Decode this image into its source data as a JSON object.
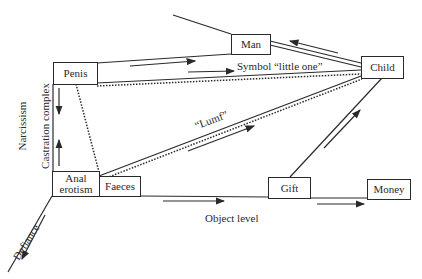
{
  "diagram": {
    "nodes": {
      "penis": "Penis",
      "man": "Man",
      "child": "Child",
      "anal_erotism": "Anal erotism",
      "faeces": "Faeces",
      "gift": "Gift",
      "money": "Money"
    },
    "edge_labels": {
      "symbol": "Symbol “little one”",
      "lumf": "“Lumf”",
      "object_level": "Object level",
      "defiance": "Defiance",
      "castration": "Castration complex",
      "narcissism": "Narcissism"
    },
    "colors": {
      "ink": "#2a2a2a",
      "background": "#ffffff"
    }
  }
}
